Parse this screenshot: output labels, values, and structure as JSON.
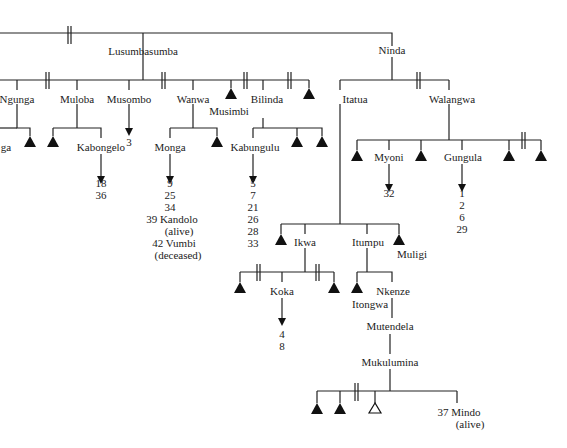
{
  "diagram": {
    "type": "kinship-genealogy",
    "people": [
      {
        "id": "lusumbasumba",
        "label": "Lusumbasumba",
        "x": 147,
        "y": 52
      },
      {
        "id": "ninda",
        "label": "Ninda",
        "x": 392,
        "y": 52
      },
      {
        "id": "ngunga",
        "label": "Ngunga",
        "x": 17,
        "y": 99
      },
      {
        "id": "muloba",
        "label": "Muloba",
        "x": 77,
        "y": 99
      },
      {
        "id": "musombo",
        "label": "Musombo",
        "x": 129,
        "y": 99
      },
      {
        "id": "wanwa",
        "label": "Wanwa",
        "x": 193,
        "y": 99
      },
      {
        "id": "musimbi",
        "label": "Musimbi",
        "x": 229,
        "y": 113
      },
      {
        "id": "bilinda",
        "label": "Bilinda",
        "x": 263,
        "y": 99
      },
      {
        "id": "itatua",
        "label": "Itatua",
        "x": 354,
        "y": 99
      },
      {
        "id": "walangwa",
        "label": "Walangwa",
        "x": 449,
        "y": 99
      },
      {
        "id": "nga",
        "label": "ga",
        "x": 4,
        "y": 148
      },
      {
        "id": "kabongelo",
        "label": "Kabongelo",
        "x": 101,
        "y": 148
      },
      {
        "id": "monga",
        "label": "Monga",
        "x": 170,
        "y": 148
      },
      {
        "id": "kabungulu",
        "label": "Kabungulu",
        "x": 253,
        "y": 148
      },
      {
        "id": "myoni",
        "label": "Myoni",
        "x": 389,
        "y": 158
      },
      {
        "id": "gungula",
        "label": "Gungula",
        "x": 462,
        "y": 158
      },
      {
        "id": "ikwa",
        "label": "Ikwa",
        "x": 305,
        "y": 243
      },
      {
        "id": "itumpu",
        "label": "Itumpu",
        "x": 367,
        "y": 243
      },
      {
        "id": "muligi",
        "label": "Muligi",
        "x": 413,
        "y": 256
      },
      {
        "id": "koka",
        "label": "Koka",
        "x": 282,
        "y": 293
      },
      {
        "id": "itongwa",
        "label": "Itongwa",
        "x": 372,
        "y": 305
      },
      {
        "id": "nkenze",
        "label": "Nkenze",
        "x": 392,
        "y": 292
      },
      {
        "id": "mutendela",
        "label": "Mutendela",
        "x": 389,
        "y": 328
      },
      {
        "id": "mukulumina",
        "label": "Mukulumina",
        "x": 390,
        "y": 364
      },
      {
        "id": "mindo",
        "label": "37  Mindo",
        "x": 460,
        "y": 413
      },
      {
        "id": "mindo_status",
        "label": "(alive)",
        "x": 470,
        "y": 426
      }
    ],
    "number_lists": [
      {
        "owner": "musombo",
        "x": 129,
        "y": 136,
        "values": [
          "3"
        ]
      },
      {
        "owner": "kabongelo",
        "x": 101,
        "y": 187,
        "values": [
          "18",
          "36"
        ]
      },
      {
        "owner": "monga",
        "x": 170,
        "y": 187,
        "values": [
          "9",
          "25",
          "34"
        ]
      },
      {
        "owner": "kabungulu",
        "x": 253,
        "y": 187,
        "values": [
          "5",
          "7",
          "21",
          "26",
          "28",
          "33"
        ]
      },
      {
        "owner": "myoni",
        "x": 389,
        "y": 195,
        "values": [
          "32"
        ]
      },
      {
        "owner": "gungula",
        "x": 462,
        "y": 195,
        "values": [
          "1",
          "2",
          "6",
          "29"
        ]
      },
      {
        "owner": "koka",
        "x": 282,
        "y": 330,
        "values": [
          "4",
          "8"
        ]
      }
    ],
    "annotations": [
      {
        "label": "39  Kandolo",
        "x": 172,
        "y": 235
      },
      {
        "label": "(alive)",
        "x": 179,
        "y": 247
      },
      {
        "label": "42  Vumbi",
        "x": 174,
        "y": 259
      },
      {
        "label": "(deceased)",
        "x": 178,
        "y": 271
      }
    ],
    "legend": {
      "filled_triangle": "male (deceased / unnamed)",
      "open_triangle": "male (ego)",
      "double_bar": "divorce / separation",
      "arrow": "descendants listed below"
    }
  }
}
